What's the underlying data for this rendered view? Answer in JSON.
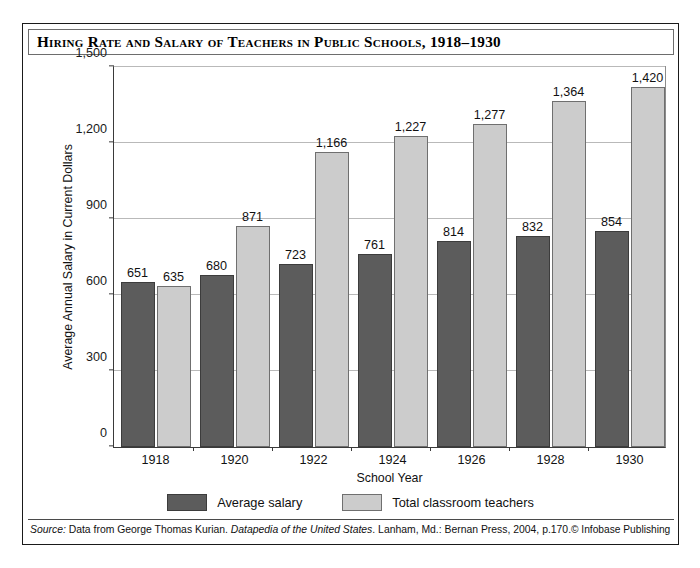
{
  "figure": {
    "title": "Hiring Rate and Salary of Teachers in Public Schools, 1918–1930",
    "source_prefix": "Source:",
    "source_body_1": " Data from George Thomas Kurian. ",
    "source_italic": "Datapedia of the United States",
    "source_body_2": ". Lanham, Md.: Bernan Press, 2004, p.170.",
    "copyright": "© Infobase Publishing"
  },
  "colors": {
    "dark_bar": "#5c5c5c",
    "light_bar": "#cccccc",
    "gridline": "#b9b9b9",
    "axis": "#3a3a3a",
    "frame": "#1a1a1a"
  },
  "chart_data": {
    "type": "bar",
    "title": "Hiring Rate and Salary of Teachers in Public Schools, 1918–1930",
    "xlabel": "School Year",
    "ylabel": "Average Annual Salary in Current Dollars",
    "categories": [
      "1918",
      "1920",
      "1922",
      "1924",
      "1926",
      "1928",
      "1930"
    ],
    "series": [
      {
        "name": "Average salary",
        "color": "#5c5c5c",
        "values": [
          651,
          680,
          723,
          761,
          814,
          832,
          854
        ],
        "labels": [
          "651",
          "680",
          "723",
          "761",
          "814",
          "832",
          "854"
        ]
      },
      {
        "name": "Total classroom teachers",
        "color": "#cccccc",
        "values": [
          635,
          871,
          1166,
          1227,
          1277,
          1364,
          1420
        ],
        "labels": [
          "635",
          "871",
          "1,166",
          "1,227",
          "1,277",
          "1,364",
          "1,420"
        ]
      }
    ],
    "ylim": [
      0,
      1500
    ],
    "yticks": [
      0,
      300,
      600,
      900,
      1200,
      1500
    ],
    "ytick_labels": [
      "0",
      "300",
      "600",
      "900",
      "1,200",
      "1,500"
    ],
    "grid": "horizontal",
    "legend_position": "bottom"
  }
}
